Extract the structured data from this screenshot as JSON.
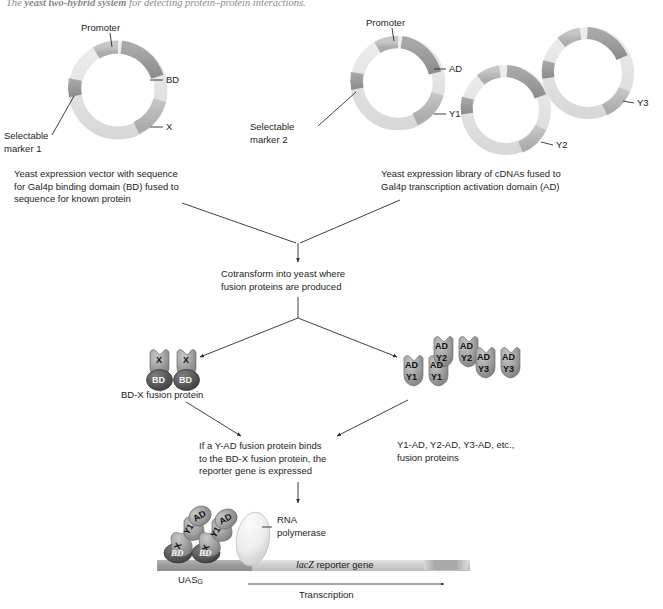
{
  "figure": {
    "title_prefix": "The ",
    "title_italic": "yeast two-hybrid system",
    "title_rest": " for detecting protein–protein interactions."
  },
  "plasmid_bd": {
    "promoter_label": "Promoter",
    "bd_label": "BD",
    "x_label": "X",
    "marker_label": "Selectable\nmarker 1",
    "caption": "Yeast expression vector with sequence\nfor Gal4p binding domain (BD) fused to\nsequence for known protein"
  },
  "plasmid_ad": {
    "promoter_label": "Promoter",
    "ad_label": "AD",
    "y1_label": "Y1",
    "y2_label": "Y2",
    "y3_label": "Y3",
    "marker_label": "Selectable\nmarker 2",
    "caption": "Yeast expression library of cDNAs fused to\nGal4p transcription activation domain (AD)"
  },
  "steps": {
    "cotransform": "Cotransform into yeast where\nfusion proteins are produced",
    "binding": "If a Y-AD fusion protein binds\nto the BD-X fusion protein, the\nreporter gene is expressed"
  },
  "products": {
    "bd_x_caption": "BD-X fusion protein",
    "ad_y_caption": "Y1-AD, Y2-AD, Y3-AD, etc.,\nfusion proteins",
    "bd_x": [
      {
        "top": "X",
        "bottom": "BD"
      },
      {
        "top": "X",
        "bottom": "BD"
      }
    ],
    "ad_y_groups": [
      {
        "name": "Y1",
        "units": [
          {
            "top": "AD",
            "bottom": "Y1"
          },
          {
            "top": "AD",
            "bottom": "Y1"
          }
        ]
      },
      {
        "name": "Y2",
        "units": [
          {
            "top": "AD",
            "bottom": "Y2"
          },
          {
            "top": "AD",
            "bottom": "Y2"
          }
        ]
      },
      {
        "name": "Y3",
        "units": [
          {
            "top": "AD",
            "bottom": "Y3"
          },
          {
            "top": "AD",
            "bottom": "Y3"
          }
        ]
      }
    ]
  },
  "transcription": {
    "rna_pol_label": "RNA\npolymerase",
    "uas_label": "UAS",
    "uas_subscript": "G",
    "reporter_italic": "lacZ",
    "reporter_rest": " reporter gene",
    "transcription_label": "Transcription",
    "complex_units": [
      {
        "ad": "AD",
        "y": "Y1",
        "x": "X",
        "bd": "BD"
      },
      {
        "ad": "AD",
        "y": "Y1",
        "x": "X",
        "bd": "BD"
      }
    ]
  },
  "colors": {
    "plasmid_dark": "#9a9a9a",
    "plasmid_mid": "#b9b9b9",
    "plasmid_light": "#e2e2e2",
    "protein_gray": "#9d9d9d",
    "protein_dark": "#555555",
    "rnapol": "#e6e6e6",
    "dna_bar": "#c9c9c9",
    "uas_bar": "#9e9e9e",
    "line": "#2b2b2b"
  }
}
